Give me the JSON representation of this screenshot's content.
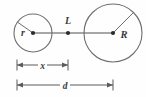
{
  "figure": {
    "name": "two-circles-separation-diagram",
    "background_color": "#fefefe",
    "width": 146,
    "height": 97,
    "stroke_color": "#6e6e6e",
    "axis_line_color": "#8a8a8a",
    "dimension_line_color": "#5a5a5a",
    "label_color": "#3a3a3a",
    "dot_color": "#2b2b2b"
  },
  "labels": {
    "small_radius": "r",
    "large_radius": "R",
    "mid_point": "L",
    "partial_distance": "x",
    "total_distance": "d"
  },
  "chart_data": {
    "type": "diagram",
    "title": "",
    "elements": [
      {
        "id": "small-circle",
        "shape": "circle",
        "cx": 33,
        "cy": 33,
        "radius": 19,
        "label": "r",
        "label_x": 23,
        "label_y": 36,
        "radius_line_angle_deg": 145
      },
      {
        "id": "large-circle",
        "shape": "circle",
        "cx": 113,
        "cy": 33,
        "radius": 29,
        "label": "R",
        "label_x": 124,
        "label_y": 38,
        "radius_line_angle_deg": 45
      },
      {
        "id": "center-line",
        "shape": "line",
        "x1": 33,
        "y1": 33,
        "x2": 113,
        "y2": 33
      },
      {
        "id": "mid-point",
        "shape": "point",
        "cx": 68,
        "cy": 33,
        "label": "L",
        "label_x": 68,
        "label_y": 24
      },
      {
        "id": "dimension-x",
        "shape": "dimension",
        "x1": 17,
        "x2": 68,
        "y": 65,
        "label": "x",
        "label_x": 42,
        "label_y": 68
      },
      {
        "id": "dimension-d",
        "shape": "dimension",
        "x1": 17,
        "x2": 113,
        "y": 85,
        "label": "d",
        "label_x": 65,
        "label_y": 88
      }
    ],
    "relations": [
      "x is measured from the left extremity of the small circle to point L",
      "d is measured from the left extremity of the small circle to the center of the large circle",
      "r is the radius of the small circle",
      "R is the radius of the large circle"
    ]
  }
}
